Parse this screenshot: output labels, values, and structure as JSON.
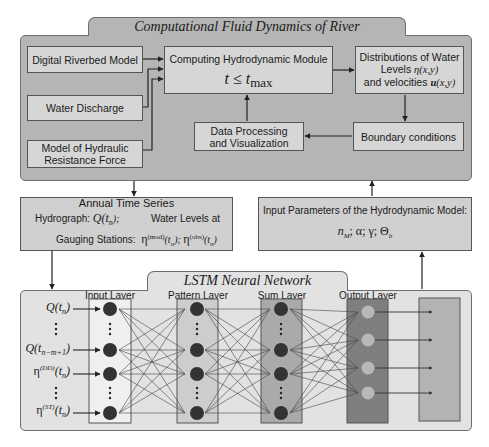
{
  "cfd_panel": {
    "title": "Computational Fluid Dynamics of River",
    "inputs": [
      "Digital Riverbed Model",
      "Water Discharge",
      "Model of Hydraulic Resistance Force"
    ],
    "compute_module": {
      "title": "Computing Hydrodynamic Module",
      "condition_lhs": "t ≤ t",
      "condition_sub": "max"
    },
    "distributions": {
      "line1": "Distributions of Water",
      "line2_text": "Levels ",
      "line2_math": "η(x,y)",
      "line3_text": "and velocities ",
      "line3_math_bold": "u",
      "line3_math": "(x,y)"
    },
    "data_processing": {
      "line1": "Data Processing",
      "line2": "and Visualization"
    },
    "boundary": "Boundary conditions"
  },
  "annual_series": {
    "title": "Annual  Time  Series",
    "hydrograph_label": "Hydrograph: ",
    "hydrograph_math": "Q(t",
    "hydrograph_sub": "n",
    "hydrograph_end": ");",
    "water_levels_label": "Water Levels at",
    "gauging_label": "Gauging Stations:",
    "eta_mod": "η",
    "mod_sup": "(mod)",
    "eta_obs": "η",
    "obs_sup": "(obs)",
    "t_n": "(t",
    "n": "n",
    "close": ")"
  },
  "input_params": {
    "title": "Input Parameters of the Hydrodynamic Model:",
    "params": "n_M; α; γ; Θ_b"
  },
  "lstm_panel": {
    "title": "LSTM Neural Network",
    "layers": [
      "Input Layer",
      "Pattern Layer",
      "Sum Layer",
      "Output Layer"
    ],
    "inputs": [
      {
        "base": "Q(t",
        "sub": "n",
        "sup": "",
        "end": ")"
      },
      {
        "base": "Q(t",
        "sub": "n−m+1",
        "sup": "",
        "end": ")"
      },
      {
        "base": "η",
        "sup": "(DD)",
        "sub": "n",
        "end": ")"
      },
      {
        "base": "η",
        "sup": "(ST)",
        "sub": "n",
        "end": ")"
      }
    ],
    "outputs": [
      "n",
      "α",
      "γ",
      "Θ"
    ],
    "output_subs": [
      "M",
      "",
      "",
      "b"
    ]
  },
  "colors": {
    "panel": "#b5b5b5",
    "box": "#d6d6d6",
    "input_layer": "#e6e6e6",
    "pattern_layer": "#c8c8c8",
    "sum_layer": "#a8a8a8",
    "output_layer": "#7c7c7c",
    "params_box": "#b0b0b0",
    "node_dark": "#333333",
    "node_light": "#b8b8b8"
  }
}
